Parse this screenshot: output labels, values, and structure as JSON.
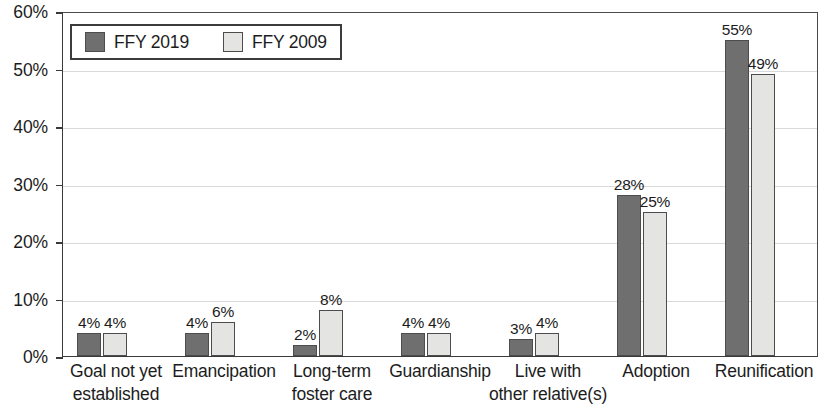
{
  "chart_data": {
    "type": "bar",
    "title": "",
    "xlabel": "",
    "ylabel": "",
    "ylim": [
      0,
      60
    ],
    "ytick_labels": [
      "0%",
      "10%",
      "20%",
      "30%",
      "40%",
      "50%",
      "60%"
    ],
    "ytick_values": [
      0,
      10,
      20,
      30,
      40,
      50,
      60
    ],
    "grid": true,
    "legend_position": "top-left",
    "categories": [
      "Goal not yet established",
      "Emancipation",
      "Long-term foster care",
      "Guardianship",
      "Live with other relative(s)",
      "Adoption",
      "Reunification"
    ],
    "category_lines": [
      [
        "Goal not yet",
        "established"
      ],
      [
        "Emancipation",
        ""
      ],
      [
        "Long-term",
        "foster care"
      ],
      [
        "Guardianship",
        ""
      ],
      [
        "Live with",
        "other relative(s)"
      ],
      [
        "Adoption",
        ""
      ],
      [
        "Reunification",
        ""
      ]
    ],
    "series": [
      {
        "name": "FFY 2019",
        "color": "#706f6f",
        "values": [
          4,
          4,
          2,
          4,
          3,
          28,
          55
        ],
        "labels": [
          "4%",
          "4%",
          "2%",
          "4%",
          "3%",
          "28%",
          "55%"
        ]
      },
      {
        "name": "FFY 2009",
        "color": "#e4e4e2",
        "values": [
          4,
          6,
          8,
          4,
          4,
          25,
          49
        ],
        "labels": [
          "4%",
          "6%",
          "8%",
          "4%",
          "4%",
          "25%",
          "49%"
        ]
      }
    ]
  },
  "legend": {
    "entries": [
      {
        "label": "FFY 2019",
        "color": "#706f6f"
      },
      {
        "label": "FFY 2009",
        "color": "#e4e4e2"
      }
    ]
  }
}
